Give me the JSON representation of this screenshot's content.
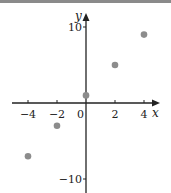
{
  "chart_data": {
    "type": "scatter",
    "title": "",
    "xlabel": "x",
    "ylabel": "y",
    "xlim": [
      -5,
      5
    ],
    "ylim": [
      -12,
      12
    ],
    "grid": false,
    "x_ticks": [
      -4,
      -2,
      0,
      2,
      4
    ],
    "x_tick_labels": [
      "−4",
      "−2",
      "0",
      "2",
      "4"
    ],
    "y_ticks": [
      10,
      -10
    ],
    "y_tick_labels": [
      "10",
      "−10"
    ],
    "series": [
      {
        "name": "points",
        "color": "#8c8c8c",
        "x": [
          -4,
          -2,
          0,
          2,
          4
        ],
        "y": [
          -7,
          -3,
          1,
          5,
          9
        ]
      }
    ]
  },
  "colors": {
    "axis": "#222222",
    "point": "#8c8c8c",
    "topbar": "#8a8a8a"
  }
}
